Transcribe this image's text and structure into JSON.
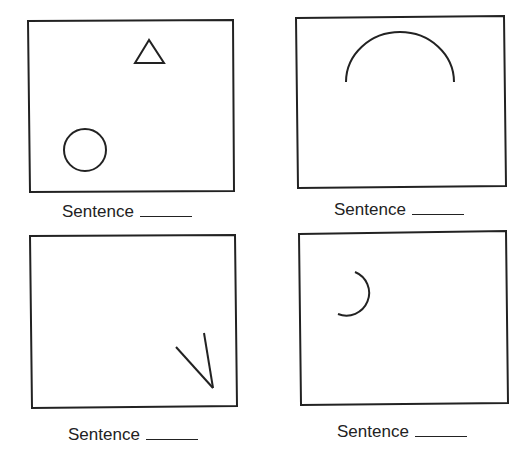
{
  "panels": [
    {
      "id": 1,
      "caption": "Sentence",
      "shapes": [
        "triangle",
        "circle"
      ]
    },
    {
      "id": 2,
      "caption": "Sentence",
      "shapes": [
        "semicircle-arc"
      ]
    },
    {
      "id": 3,
      "caption": "Sentence",
      "shapes": [
        "v-lines"
      ]
    },
    {
      "id": 4,
      "caption": "Sentence",
      "shapes": [
        "small-arc"
      ]
    }
  ],
  "colors": {
    "stroke": "#222222",
    "background": "#ffffff"
  }
}
